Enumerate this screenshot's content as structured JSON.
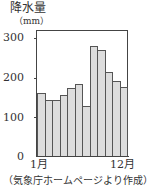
{
  "chart_data": {
    "type": "bar",
    "title": "",
    "ylabel": "降水量",
    "yunit": "（mm）",
    "xlabel": "",
    "categories": [
      "1月",
      "2月",
      "3月",
      "4月",
      "5月",
      "6月",
      "7月",
      "8月",
      "9月",
      "10月",
      "11月",
      "12月"
    ],
    "values": [
      162,
      145,
      144,
      157,
      174,
      186,
      128,
      282,
      271,
      214,
      192,
      176
    ],
    "ylim": [
      0,
      320
    ],
    "yticks": [
      "300",
      "200",
      "100",
      "0"
    ],
    "xtick_labels": {
      "first": "1月",
      "last": "12月"
    },
    "grid": false,
    "legend": null,
    "source_note": "（気象庁ホームページより作成）",
    "bar_color": "#dddddd"
  }
}
